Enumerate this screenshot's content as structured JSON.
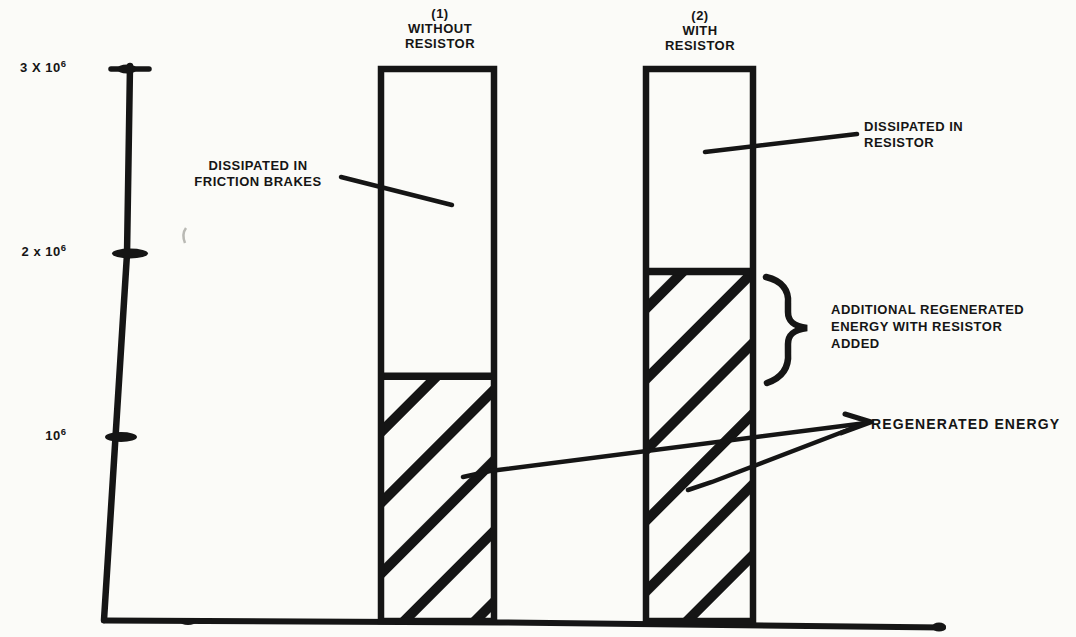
{
  "figure": {
    "labels": {
      "bar1_header": "(1)\nWITHOUT\nRESISTOR",
      "bar2_header": "(2)\nWITH\nRESISTOR",
      "dissipated_friction": "DISSIPATED IN\nFRICTION BRAKES",
      "dissipated_resistor": "DISSIPATED IN\nRESISTOR",
      "additional_regenerated": "ADDITIONAL REGENERATED\nENERGY WITH RESISTOR\nADDED",
      "regenerated": "REGENERATED ENERGY"
    },
    "colors": {
      "ink": "#151515",
      "paper": "#fbfbf8"
    }
  },
  "chart_data": {
    "type": "bar",
    "stacked": true,
    "categories": [
      "(1) WITHOUT RESISTOR",
      "(2) WITH RESISTOR"
    ],
    "series": [
      {
        "name": "REGENERATED ENERGY",
        "style": "diagonal-hatch",
        "values": [
          1.33,
          1.9
        ]
      },
      {
        "name": "DISSIPATED (FRICTION BRAKES / RESISTOR)",
        "style": "open-white",
        "values": [
          1.67,
          1.1
        ]
      }
    ],
    "value_unit_multiplier": "10^6",
    "xlabel": "",
    "ylabel": "",
    "ylim": [
      0,
      3.3
    ],
    "grid": false,
    "legend_position": "none",
    "yticks": [
      {
        "value": 3,
        "base": "3 X 10",
        "sup": "6"
      },
      {
        "value": 2,
        "base": "2 x 10",
        "sup": "6"
      },
      {
        "value": 1,
        "base": "10",
        "sup": "6"
      }
    ],
    "annotations": [
      {
        "text": "DISSIPATED IN FRICTION BRAKES",
        "target": "upper open segment of bar 1"
      },
      {
        "text": "DISSIPATED IN RESISTOR",
        "target": "upper open segment of bar 2"
      },
      {
        "text": "ADDITIONAL REGENERATED ENERGY WITH RESISTOR ADDED",
        "target": "brace on bar 2 hatched area between 1.33 and 1.9 x 10^6"
      },
      {
        "text": "REGENERATED ENERGY",
        "target": "hatched lower segments of both bars"
      }
    ]
  }
}
